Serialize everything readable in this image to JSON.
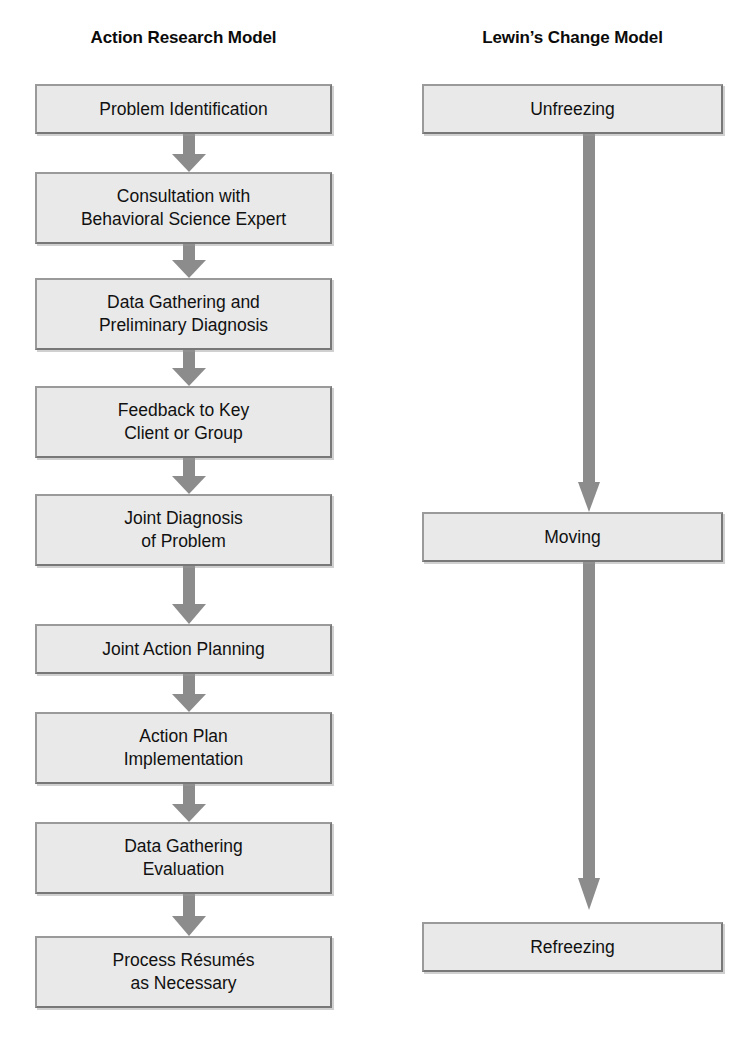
{
  "diagram": {
    "title_left": "Action Research Model",
    "title_right": "Lewin’s Change Model",
    "colors": {
      "box_fill": "#e9e9e9",
      "box_border": "#8a8a8a",
      "arrow": "#8c8c8c",
      "text": "#111111",
      "background": "#ffffff"
    },
    "left_column": {
      "title": "Action Research Model",
      "steps": [
        {
          "label": "Problem Identification",
          "lines": 1
        },
        {
          "label": "Consultation with\nBehavioral Science Expert",
          "lines": 2
        },
        {
          "label": "Data Gathering and\nPreliminary Diagnosis",
          "lines": 2
        },
        {
          "label": "Feedback to Key\nClient or Group",
          "lines": 2
        },
        {
          "label": "Joint Diagnosis\nof Problem",
          "lines": 2
        },
        {
          "label": "Joint Action Planning",
          "lines": 1
        },
        {
          "label": "Action Plan\nImplementation",
          "lines": 2
        },
        {
          "label": "Data Gathering\nEvaluation",
          "lines": 2
        },
        {
          "label": "Process Résumés\nas Necessary",
          "lines": 2
        }
      ]
    },
    "right_column": {
      "title": "Lewin’s Change Model",
      "steps": [
        {
          "label": "Unfreezing",
          "lines": 1
        },
        {
          "label": "Moving",
          "lines": 1
        },
        {
          "label": "Refreezing",
          "lines": 1
        }
      ]
    }
  }
}
